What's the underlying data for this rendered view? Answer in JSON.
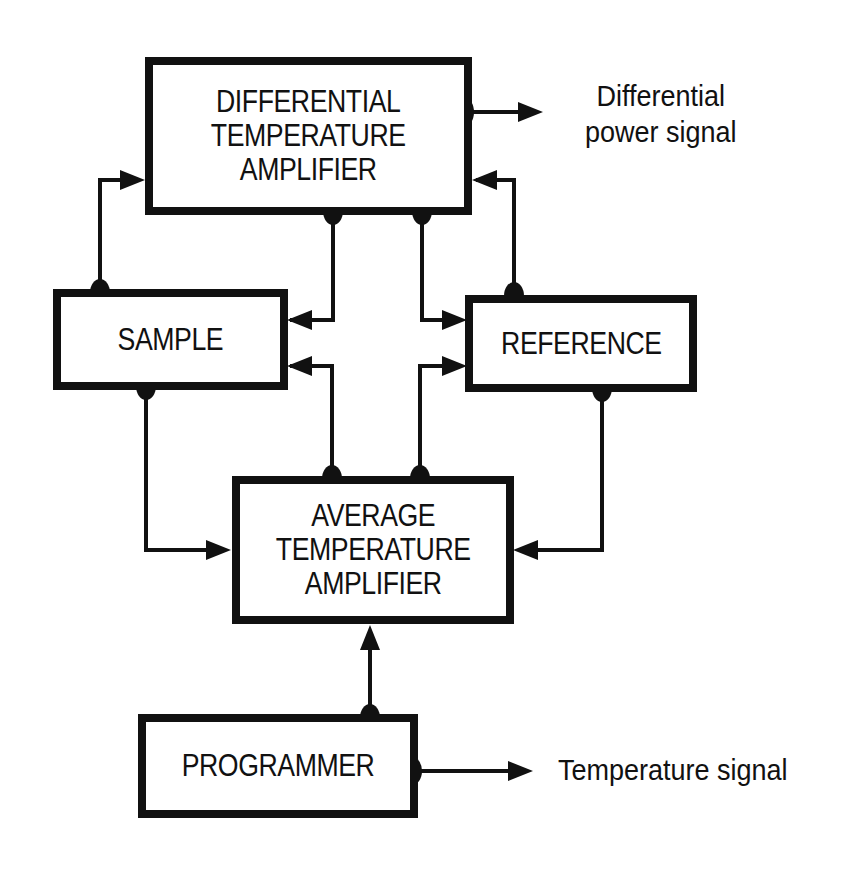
{
  "diagram": {
    "type": "block-diagram",
    "colors": {
      "line": "#111111",
      "background": "#ffffff"
    },
    "blocks": {
      "diff_amp": {
        "label": "DIFFERENTIAL\nTEMPERATURE\nAMPLIFIER"
      },
      "sample": {
        "label": "SAMPLE"
      },
      "reference": {
        "label": "REFERENCE"
      },
      "avg_amp": {
        "label": "AVERAGE\nTEMPERATURE\nAMPLIFIER"
      },
      "programmer": {
        "label": "PROGRAMMER"
      }
    },
    "outputs": {
      "differential_power": {
        "label": "Differential\npower signal"
      },
      "temperature": {
        "label": "Temperature signal"
      }
    },
    "connections": [
      {
        "from": "sample",
        "to": "diff_amp"
      },
      {
        "from": "reference",
        "to": "diff_amp"
      },
      {
        "from": "diff_amp",
        "to": "sample"
      },
      {
        "from": "diff_amp",
        "to": "reference"
      },
      {
        "from": "avg_amp",
        "to": "sample"
      },
      {
        "from": "avg_amp",
        "to": "reference"
      },
      {
        "from": "sample",
        "to": "avg_amp"
      },
      {
        "from": "reference",
        "to": "avg_amp"
      },
      {
        "from": "programmer",
        "to": "avg_amp"
      },
      {
        "from": "diff_amp",
        "to": "differential_power"
      },
      {
        "from": "programmer",
        "to": "temperature"
      }
    ]
  }
}
